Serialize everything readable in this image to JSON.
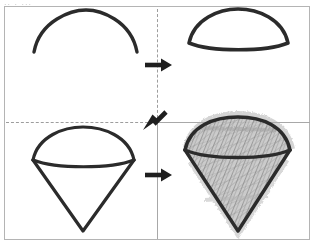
{
  "document": {
    "title": "How to draw an ice cream cone - 4 step grid",
    "type": "step-by-step drawing instruction sheet",
    "top_crop_text": "..  . ...",
    "background_color": "#ffffff",
    "ink_color": "#2b2b2b",
    "frame_color": "#b4b4b4",
    "divider_solid_color": "#a8a8a8",
    "divider_dashed_color": "#9d9d9d",
    "shading_color": "#a5a5a5"
  },
  "grid": {
    "rows": 2,
    "columns": 2,
    "panel_count": 4,
    "dividers": [
      {
        "name": "vertical-top",
        "style": "dashed"
      },
      {
        "name": "vertical-bottom",
        "style": "solid"
      },
      {
        "name": "horizontal-left",
        "style": "dashed"
      },
      {
        "name": "horizontal-right",
        "style": "solid"
      }
    ]
  },
  "panels": [
    {
      "id": "step-1",
      "position": "top-left",
      "step_number": 1,
      "caption": "",
      "drawing": "open-arc-dome",
      "description": "A single open curved arc forming a dome / hill outline",
      "filled": false,
      "shaded": false
    },
    {
      "id": "step-2",
      "position": "top-right",
      "step_number": 2,
      "caption": "",
      "drawing": "closed-dome",
      "description": "The arc closed off with a gently downward-curving base line, forming a scoop",
      "filled": false,
      "shaded": false
    },
    {
      "id": "step-3",
      "position": "bottom-left",
      "step_number": 3,
      "caption": "",
      "drawing": "ice-cream-cone-outline",
      "description": "The dome sits on an inverted triangular cone with a pointed tip",
      "filled": false,
      "shaded": false
    },
    {
      "id": "step-4",
      "position": "bottom-right",
      "step_number": 4,
      "caption": "",
      "drawing": "ice-cream-cone-shaded",
      "description": "The same cone finished with rough grey pencil cross-hatch shading",
      "filled": false,
      "shaded": true
    }
  ],
  "arrows": [
    {
      "id": "arrow-top",
      "label": "",
      "direction": "right",
      "from_panel": "step-1",
      "to_panel": "step-2"
    },
    {
      "id": "arrow-diagonal",
      "label": "",
      "direction": "down-left",
      "from_panel": "step-2",
      "to_panel": "step-3"
    },
    {
      "id": "arrow-bottom",
      "label": "",
      "direction": "right",
      "from_panel": "step-3",
      "to_panel": "step-4"
    }
  ]
}
